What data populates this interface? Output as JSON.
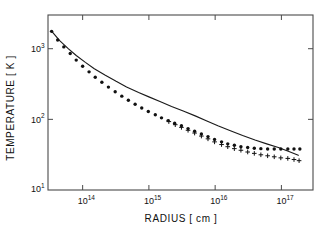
{
  "figure": {
    "background_color": "#ffffff",
    "frame_color": "#4a4a4a",
    "ink_color": "#111111"
  },
  "chart_data": {
    "type": "scatter",
    "title": "",
    "subtitle": "",
    "xlabel": "RADIUS [ cm ]",
    "ylabel": "TEMPERATURE [ K ]",
    "xscale": "log",
    "yscale": "log",
    "xlim": [
      30000000000000.0,
      3e+17
    ],
    "ylim": [
      10,
      3000
    ],
    "grid": false,
    "legend": "none",
    "annotations": [],
    "x_tick_labels": [
      "10",
      "10",
      "10",
      "10"
    ],
    "x_tick_exponents": [
      "14",
      "15",
      "16",
      "17"
    ],
    "x_tick_values": [
      100000000000000.0,
      1000000000000000.0,
      1e+16,
      1e+17
    ],
    "y_tick_labels": [
      "10",
      "10",
      "10"
    ],
    "y_tick_exponents": [
      "3",
      "2",
      "1"
    ],
    "y_tick_values": [
      1000,
      100,
      10
    ],
    "series": [
      {
        "name": "model curve",
        "marker": "solid-line",
        "style": "line",
        "x": [
          34000000000000.0,
          45000000000000.0,
          60000000000000.0,
          80000000000000.0,
          110000000000000.0,
          150000000000000.0,
          220000000000000.0,
          320000000000000.0,
          460000000000000.0,
          700000000000000.0,
          1000000000000000.0,
          1500000000000000.0,
          2200000000000000.0,
          3300000000000000.0,
          5000000000000000.0,
          7500000000000000.0,
          1.1e+16,
          1.7e+16,
          2.6e+16,
          4e+16,
          6e+16,
          9e+16,
          1.3e+17,
          1.8e+17
        ],
        "y": [
          1780,
          1300,
          1010,
          800,
          640,
          520,
          420,
          345,
          288,
          240,
          208,
          178,
          152,
          131,
          112,
          95,
          81,
          69,
          59,
          51,
          45,
          40,
          35,
          31
        ]
      },
      {
        "name": "dots",
        "marker": "filled-circle",
        "style": "scatter",
        "x": [
          34000000000000.0,
          42000000000000.0,
          52000000000000.0,
          65000000000000.0,
          80000000000000.0,
          100000000000000.0,
          125000000000000.0,
          155000000000000.0,
          195000000000000.0,
          245000000000000.0,
          310000000000000.0,
          390000000000000.0,
          490000000000000.0,
          620000000000000.0,
          780000000000000.0,
          980000000000000.0,
          1250000000000000.0,
          1550000000000000.0,
          1950000000000000.0,
          2450000000000000.0,
          3100000000000000.0,
          3900000000000000.0,
          4900000000000000.0,
          6200000000000000.0,
          7800000000000000.0,
          9800000000000000.0,
          1.25e+16,
          1.55e+16,
          1.95e+16,
          2.45e+16,
          3.1e+16,
          3.9e+16,
          4.9e+16,
          6.2e+16,
          7.8e+16,
          9.8e+16,
          1.25e+17,
          1.55e+17,
          1.9e+17
        ],
        "y": [
          1760,
          1330,
          1060,
          855,
          690,
          565,
          470,
          395,
          335,
          286,
          246,
          213,
          186,
          164,
          145,
          129,
          116,
          105,
          96,
          88,
          81,
          74,
          68,
          62,
          57,
          52,
          48,
          45,
          43,
          41,
          40,
          39,
          38.5,
          38,
          38,
          38,
          38,
          38,
          38
        ]
      },
      {
        "name": "plus",
        "marker": "plus",
        "style": "scatter",
        "x": [
          2000000000000000.0,
          2500000000000000.0,
          3100000000000000.0,
          3900000000000000.0,
          4900000000000000.0,
          6200000000000000.0,
          7800000000000000.0,
          9800000000000000.0,
          1.25e+16,
          1.55e+16,
          1.95e+16,
          2.45e+16,
          3.1e+16,
          3.9e+16,
          4.9e+16,
          6.2e+16,
          7.8e+16,
          9.8e+16,
          1.25e+17,
          1.55e+17,
          1.85e+17
        ],
        "y": [
          93,
          84,
          77,
          70,
          64,
          58,
          53,
          48,
          44,
          41,
          38.5,
          36.5,
          34.5,
          33,
          31.5,
          30.5,
          29.5,
          28.5,
          28,
          27,
          26
        ]
      }
    ]
  }
}
